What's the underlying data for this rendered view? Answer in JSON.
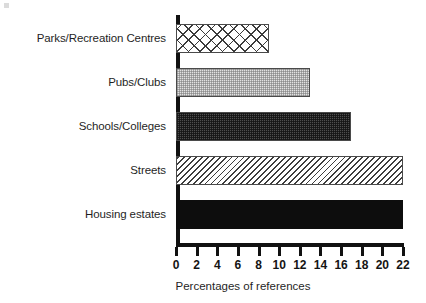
{
  "chart_data": {
    "type": "bar",
    "orientation": "horizontal",
    "title": "",
    "xlabel": "Percentages of references",
    "ylabel": "",
    "categories": [
      "Housing estates",
      "Streets",
      "Schools/Colleges",
      "Pubs/Clubs",
      "Parks/Recreation Centres"
    ],
    "values": [
      22,
      22,
      17,
      13,
      9
    ],
    "xlim": [
      0,
      22
    ],
    "xticks": [
      0,
      2,
      4,
      6,
      8,
      10,
      12,
      14,
      16,
      18,
      20,
      22
    ],
    "xtick_labels": [
      "0",
      "2",
      "4",
      "6",
      "8",
      "10",
      "12",
      "14",
      "16",
      "18",
      "20",
      "22"
    ],
    "grid": false,
    "legend": false,
    "series": [
      {
        "name": "Percentages of references",
        "values": [
          22,
          22,
          17,
          13,
          9
        ]
      }
    ],
    "bars": [
      {
        "category": "Parks/Recreation Centres",
        "value": 9,
        "pattern": "crosshatch",
        "fill_color": "#ffffff",
        "edge_color": "#4a4a4a"
      },
      {
        "category": "Pubs/Clubs",
        "value": 13,
        "pattern": "light-check",
        "fill_color": "#e2e2e2",
        "edge_color": "#4a4a4a"
      },
      {
        "category": "Schools/Colleges",
        "value": 17,
        "pattern": "dark-check",
        "fill_color": "#4e4e4e",
        "edge_color": "#4a4a4a"
      },
      {
        "category": "Streets",
        "value": 22,
        "pattern": "diagonal",
        "fill_color": "#ffffff",
        "edge_color": "#4a4a4a"
      },
      {
        "category": "Housing estates",
        "value": 22,
        "pattern": "solid",
        "fill_color": "#0d0d0d",
        "edge_color": "#0d0d0d"
      }
    ],
    "colors": {
      "axis": "#111111",
      "text": "#1f1f1f",
      "background": "#ffffff"
    }
  }
}
